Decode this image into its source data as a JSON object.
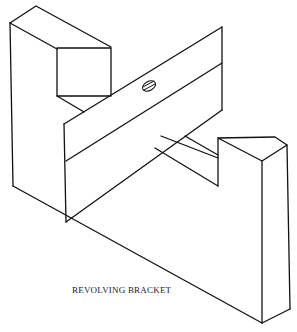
{
  "figure": {
    "caption": "REVOLVING BRACKET",
    "stroke_color": "#111111",
    "background": "#ffffff"
  },
  "parts": [
    {
      "name": "left-upright",
      "description": "Tall vertical support on the left with base extending diagonally right"
    },
    {
      "name": "left-block",
      "description": "Rectangular block on top of left upright"
    },
    {
      "name": "revolving-bar",
      "description": "Flat bar pivoting across the bracket, split by a horizontal line"
    },
    {
      "name": "pivot-screw",
      "description": "Slotted screw head on the bar"
    },
    {
      "name": "right-block",
      "description": "Short block at the right end of the base"
    }
  ]
}
